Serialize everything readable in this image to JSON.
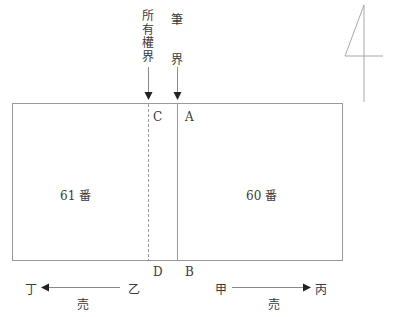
{
  "diagram": {
    "type": "boundary-plan",
    "top_labels": {
      "ownership_boundary": "所有權界",
      "parcel_boundary_1": "筆",
      "parcel_boundary_2": "界"
    },
    "points": {
      "A": "A",
      "B": "B",
      "C": "C",
      "D": "D"
    },
    "lots": {
      "left": "61 番",
      "right": "60 番"
    },
    "directions": {
      "left_start": "乙",
      "left_end": "丁",
      "left_sale": "売",
      "right_start": "甲",
      "right_end": "丙",
      "right_sale": "売"
    },
    "north_symbol": "4",
    "colors": {
      "line": "#9a9a9a",
      "text": "#3a3a3a",
      "arrow": "#222222"
    }
  }
}
